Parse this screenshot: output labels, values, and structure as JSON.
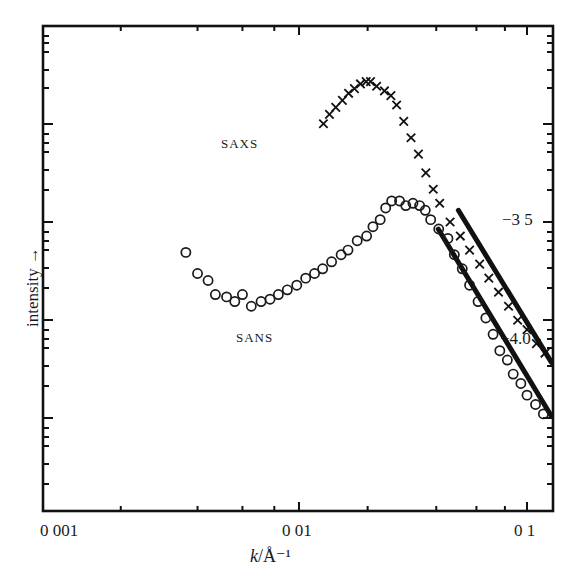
{
  "chart_data": {
    "type": "scatter",
    "title": "",
    "xlabel": "k/Å⁻¹",
    "xlabel_var": "k",
    "xlabel_unit": "/Å⁻¹",
    "ylabel": "intensity →",
    "xscale": "log",
    "yscale": "log",
    "xlim": [
      0.001,
      0.128
    ],
    "x_tick_labels": [
      "0 001",
      "0 01",
      "0 1"
    ],
    "x_tick_values": [
      0.001,
      0.01,
      0.1
    ],
    "right_axis_labels": [
      "−3 5",
      "−4.0"
    ],
    "grid": false,
    "legend": "none (inline labels)",
    "annotations": [
      "SAXS",
      "SANS",
      "−3 5",
      "−4.0"
    ],
    "series": [
      {
        "name": "SAXS",
        "marker": "x",
        "x": [
          0.0128,
          0.0136,
          0.0145,
          0.0155,
          0.0165,
          0.0175,
          0.0186,
          0.0197,
          0.0206,
          0.0219,
          0.0237,
          0.0253,
          0.0268,
          0.0288,
          0.031,
          0.0334,
          0.036,
          0.0388,
          0.0414,
          0.046,
          0.051,
          0.056,
          0.062,
          0.068,
          0.075,
          0.083,
          0.091,
          0.1,
          0.11,
          0.12
        ],
        "y_relative_log": [
          -3.08,
          -3.04,
          -3.01,
          -2.98,
          -2.95,
          -2.93,
          -2.91,
          -2.9,
          -2.9,
          -2.92,
          -2.94,
          -2.96,
          -3.0,
          -3.07,
          -3.14,
          -3.21,
          -3.29,
          -3.36,
          -3.42,
          -3.5,
          -3.56,
          -3.62,
          -3.68,
          -3.74,
          -3.8,
          -3.86,
          -3.92,
          -3.96,
          -4.02,
          -4.06
        ]
      },
      {
        "name": "SANS",
        "marker": "o",
        "x": [
          0.0036,
          0.004,
          0.0044,
          0.0047,
          0.0052,
          0.0056,
          0.006,
          0.0065,
          0.0071,
          0.0077,
          0.0083,
          0.009,
          0.0098,
          0.0107,
          0.0117,
          0.0127,
          0.0139,
          0.0153,
          0.0164,
          0.018,
          0.0198,
          0.0211,
          0.0227,
          0.024,
          0.0255,
          0.0276,
          0.0294,
          0.0316,
          0.0338,
          0.0358,
          0.0378,
          0.041,
          0.045,
          0.048,
          0.052,
          0.056,
          0.061,
          0.066,
          0.071,
          0.076,
          0.082,
          0.087,
          0.094,
          0.1,
          0.109,
          0.118
        ],
        "y_relative_log": [
          -3.63,
          -3.72,
          -3.75,
          -3.81,
          -3.82,
          -3.84,
          -3.81,
          -3.86,
          -3.84,
          -3.83,
          -3.81,
          -3.79,
          -3.77,
          -3.74,
          -3.72,
          -3.7,
          -3.67,
          -3.64,
          -3.62,
          -3.58,
          -3.56,
          -3.52,
          -3.49,
          -3.44,
          -3.41,
          -3.41,
          -3.43,
          -3.42,
          -3.43,
          -3.45,
          -3.49,
          -3.53,
          -3.57,
          -3.64,
          -3.7,
          -3.77,
          -3.84,
          -3.91,
          -3.98,
          -4.05,
          -4.09,
          -4.15,
          -4.19,
          -4.24,
          -4.28,
          -4.32
        ]
      }
    ],
    "fit_lines": [
      {
        "name": "SAXS power-law fit",
        "x_start": 0.05,
        "x_end": 0.128,
        "y_start": -3.45,
        "y_end": -4.1
      },
      {
        "name": "SANS power-law fit",
        "x_start": 0.0408,
        "x_end": 0.128,
        "y_start": -3.53,
        "y_end": -4.33
      }
    ]
  },
  "labels": {
    "saxs": "SAXS",
    "sans": "SANS",
    "ylabel": "intensity →",
    "xlabel_var": "k",
    "xlabel_unit": "/Å⁻¹",
    "x_ticks": [
      "0 001",
      "0 01",
      "0 1"
    ],
    "right_35": "−3 5",
    "right_40": "−4.0"
  }
}
